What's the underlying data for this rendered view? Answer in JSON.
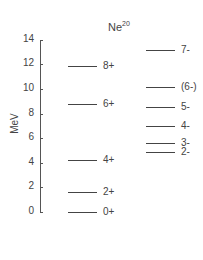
{
  "title": "Ne",
  "title_sup": "20",
  "axis": {
    "label": "MeV",
    "ticks": [
      "0",
      "2",
      "4",
      "6",
      "8",
      "10",
      "12",
      "14"
    ],
    "min": 0,
    "max": 14
  },
  "levels_left": [
    {
      "label": "0+",
      "energy": 0.0
    },
    {
      "label": "2+",
      "energy": 1.6
    },
    {
      "label": "4+",
      "energy": 4.2
    },
    {
      "label": "6+",
      "energy": 8.8
    },
    {
      "label": "8+",
      "energy": 11.9
    }
  ],
  "levels_right": [
    {
      "label": "2-",
      "energy": 4.9
    },
    {
      "label": "3-",
      "energy": 5.6
    },
    {
      "label": "4-",
      "energy": 7.0
    },
    {
      "label": "5-",
      "energy": 8.5
    },
    {
      "label": "(6-)",
      "energy": 10.2
    },
    {
      "label": "7-",
      "energy": 13.2
    }
  ]
}
